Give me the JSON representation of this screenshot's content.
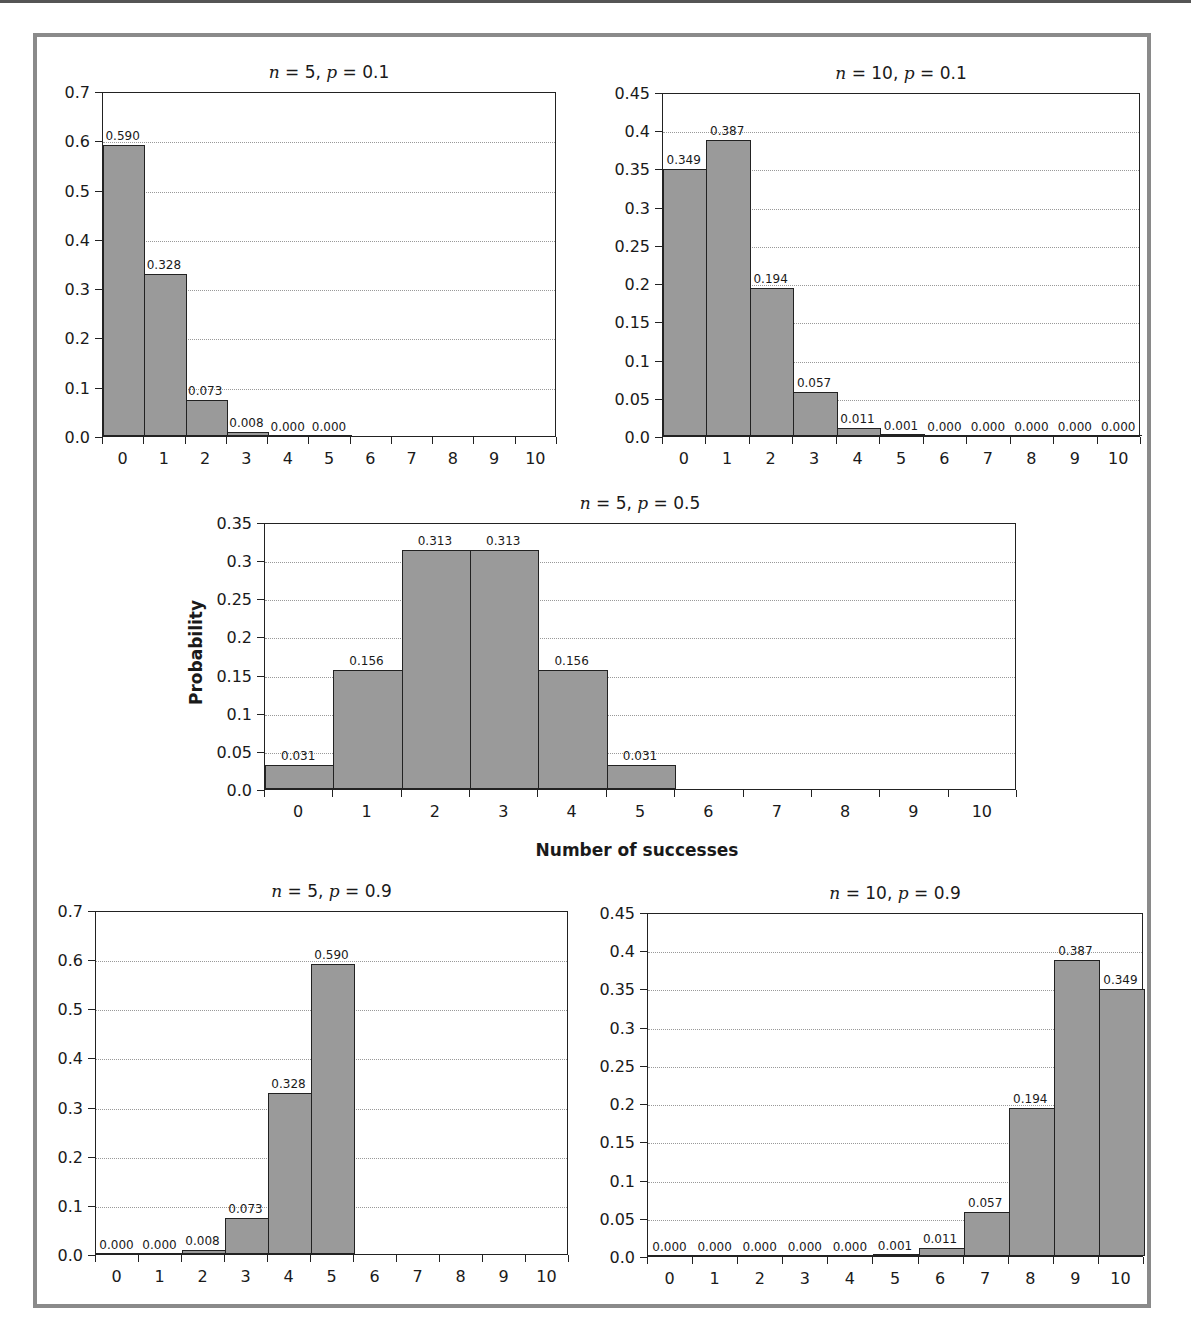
{
  "chart_data": [
    {
      "id": "n5p01",
      "type": "bar",
      "title": "n = 5, p = 0.1",
      "title_parts": {
        "n": "5",
        "p": "0.1"
      },
      "xlabel": "",
      "ylabel": "",
      "categories": [
        "0",
        "1",
        "2",
        "3",
        "4",
        "5",
        "6",
        "7",
        "8",
        "9",
        "10"
      ],
      "values": [
        0.59,
        0.328,
        0.073,
        0.008,
        0.0,
        0.0,
        null,
        null,
        null,
        null,
        null
      ],
      "labels": [
        "0.590",
        "0.328",
        "0.073",
        "0.008",
        "0.000",
        "0.000",
        "",
        "",
        "",
        "",
        ""
      ],
      "ylim": [
        0,
        0.7
      ],
      "yticks": [
        "0.0",
        "0.1",
        "0.2",
        "0.3",
        "0.4",
        "0.5",
        "0.6",
        "0.7"
      ],
      "ytick_values": [
        0,
        0.1,
        0.2,
        0.3,
        0.4,
        0.5,
        0.6,
        0.7
      ],
      "grid": true,
      "legend": "none",
      "box": {
        "x": 102,
        "y": 92,
        "w": 454,
        "h": 345
      }
    },
    {
      "id": "n10p01",
      "type": "bar",
      "title": "n = 10, p = 0.1",
      "title_parts": {
        "n": "10",
        "p": "0.1"
      },
      "xlabel": "",
      "ylabel": "",
      "categories": [
        "0",
        "1",
        "2",
        "3",
        "4",
        "5",
        "6",
        "7",
        "8",
        "9",
        "10"
      ],
      "values": [
        0.349,
        0.387,
        0.194,
        0.057,
        0.011,
        0.001,
        0.0,
        0.0,
        0.0,
        0.0,
        0.0
      ],
      "labels": [
        "0.349",
        "0.387",
        "0.194",
        "0.057",
        "0.011",
        "0.001",
        "0.000",
        "0.000",
        "0.000",
        "0.000",
        "0.000"
      ],
      "ylim": [
        0,
        0.45
      ],
      "yticks": [
        "0.0",
        "0.05",
        "0.1",
        "0.15",
        "0.2",
        "0.25",
        "0.3",
        "0.35",
        "0.4",
        "0.45"
      ],
      "ytick_values": [
        0,
        0.05,
        0.1,
        0.15,
        0.2,
        0.25,
        0.3,
        0.35,
        0.4,
        0.45
      ],
      "grid": true,
      "legend": "none",
      "box": {
        "x": 662,
        "y": 93,
        "w": 478,
        "h": 344
      }
    },
    {
      "id": "n5p05",
      "type": "bar",
      "title": "n = 5, p = 0.5",
      "title_parts": {
        "n": "5",
        "p": "0.5"
      },
      "xlabel": "Number of successes",
      "ylabel": "Probability",
      "categories": [
        "0",
        "1",
        "2",
        "3",
        "4",
        "5",
        "6",
        "7",
        "8",
        "9",
        "10"
      ],
      "values": [
        0.031,
        0.156,
        0.313,
        0.313,
        0.156,
        0.031,
        null,
        null,
        null,
        null,
        null
      ],
      "labels": [
        "0.031",
        "0.156",
        "0.313",
        "0.313",
        "0.156",
        "0.031",
        "",
        "",
        "",
        "",
        ""
      ],
      "ylim": [
        0,
        0.35
      ],
      "yticks": [
        "0.0",
        "0.05",
        "0.1",
        "0.15",
        "0.2",
        "0.25",
        "0.3",
        "0.35"
      ],
      "ytick_values": [
        0,
        0.05,
        0.1,
        0.15,
        0.2,
        0.25,
        0.3,
        0.35
      ],
      "grid": true,
      "legend": "none",
      "box": {
        "x": 264,
        "y": 523,
        "w": 752,
        "h": 267
      }
    },
    {
      "id": "n5p09",
      "type": "bar",
      "title": "n = 5, p = 0.9",
      "title_parts": {
        "n": "5",
        "p": "0.9"
      },
      "xlabel": "",
      "ylabel": "",
      "categories": [
        "0",
        "1",
        "2",
        "3",
        "4",
        "5",
        "6",
        "7",
        "8",
        "9",
        "10"
      ],
      "values": [
        0.0,
        0.0,
        0.008,
        0.073,
        0.328,
        0.59,
        null,
        null,
        null,
        null,
        null
      ],
      "labels": [
        "0.000",
        "0.000",
        "0.008",
        "0.073",
        "0.328",
        "0.590",
        "",
        "",
        "",
        "",
        ""
      ],
      "ylim": [
        0,
        0.7
      ],
      "yticks": [
        "0.0",
        "0.1",
        "0.2",
        "0.3",
        "0.4",
        "0.5",
        "0.6",
        "0.7"
      ],
      "ytick_values": [
        0,
        0.1,
        0.2,
        0.3,
        0.4,
        0.5,
        0.6,
        0.7
      ],
      "grid": true,
      "legend": "none",
      "box": {
        "x": 95,
        "y": 911,
        "w": 473,
        "h": 344
      }
    },
    {
      "id": "n10p09",
      "type": "bar",
      "title": "n = 10, p = 0.9",
      "title_parts": {
        "n": "10",
        "p": "0.9"
      },
      "xlabel": "",
      "ylabel": "",
      "categories": [
        "0",
        "1",
        "2",
        "3",
        "4",
        "5",
        "6",
        "7",
        "8",
        "9",
        "10"
      ],
      "values": [
        0.0,
        0.0,
        0.0,
        0.0,
        0.0,
        0.001,
        0.011,
        0.057,
        0.194,
        0.387,
        0.349
      ],
      "labels": [
        "0.000",
        "0.000",
        "0.000",
        "0.000",
        "0.000",
        "0.001",
        "0.011",
        "0.057",
        "0.194",
        "0.387",
        "0.349"
      ],
      "ylim": [
        0,
        0.45
      ],
      "yticks": [
        "0.0",
        "0.05",
        "0.1",
        "0.15",
        "0.2",
        "0.25",
        "0.3",
        "0.35",
        "0.4",
        "0.45"
      ],
      "ytick_values": [
        0,
        0.05,
        0.1,
        0.15,
        0.2,
        0.25,
        0.3,
        0.35,
        0.4,
        0.45
      ],
      "grid": true,
      "legend": "none",
      "box": {
        "x": 647,
        "y": 913,
        "w": 496,
        "h": 344
      }
    }
  ],
  "colors": {
    "bar_fill": "#9a9a9a",
    "bar_edge": "#222222",
    "frame": "#8a8a8a",
    "grid": "#999999"
  },
  "shared_axis": {
    "ylabel": "Probability",
    "xlabel": "Number of successes"
  }
}
